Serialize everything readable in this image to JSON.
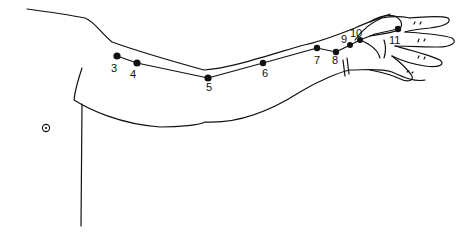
{
  "diagram": {
    "points": [
      {
        "label": "3",
        "x": 117,
        "y": 56,
        "lx": 111,
        "ly": 63
      },
      {
        "label": "4",
        "x": 137,
        "y": 63,
        "lx": 130,
        "ly": 69
      },
      {
        "label": "5",
        "x": 208,
        "y": 78,
        "lx": 206,
        "ly": 82
      },
      {
        "label": "6",
        "x": 263,
        "y": 63,
        "lx": 262,
        "ly": 68
      },
      {
        "label": "7",
        "x": 317,
        "y": 48,
        "lx": 314,
        "ly": 55
      },
      {
        "label": "8",
        "x": 336,
        "y": 52,
        "lx": 332,
        "ly": 55
      },
      {
        "label": "9",
        "x": 350,
        "y": 45,
        "lx": 341,
        "ly": 34
      },
      {
        "label": "10",
        "x": 360,
        "y": 40,
        "lx": 350,
        "ly": 28
      },
      {
        "label": "11",
        "x": 398,
        "y": 29,
        "lx": 389,
        "ly": 35
      }
    ],
    "marker": {
      "symbol": "circled-dot",
      "x": 46,
      "y": 128
    },
    "colors": {
      "ink": "#111111",
      "background": "#ffffff"
    }
  }
}
